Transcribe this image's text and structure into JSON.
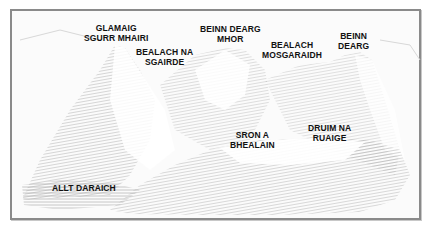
{
  "illustration": {
    "style": "pencil sketch",
    "frame_color": "#8a8a8a",
    "shade_color": "#9a9a9a",
    "labels": [
      {
        "id": "glamaig",
        "lines": [
          "GLAMAIG",
          "SGURR MHAIRI"
        ]
      },
      {
        "id": "bealach-na-sgairde",
        "lines": [
          "BEALACH NA",
          "SGAIRDE"
        ]
      },
      {
        "id": "beinn-dearg-mhor",
        "lines": [
          "BEINN DEARG",
          "MHOR"
        ]
      },
      {
        "id": "bealach-mosgaraidh",
        "lines": [
          "BEALACH",
          "MOSGARAIDH"
        ]
      },
      {
        "id": "beinn-dearg",
        "lines": [
          "BEINN",
          "DEARG"
        ]
      },
      {
        "id": "sron-a-bhealain",
        "lines": [
          "SRON A",
          "BHEALAIN"
        ]
      },
      {
        "id": "druim-na-ruaige",
        "lines": [
          "DRUIM NA",
          "RUAIGE"
        ]
      },
      {
        "id": "allt-daraich",
        "lines": [
          "ALLT DARAICH"
        ]
      }
    ]
  }
}
